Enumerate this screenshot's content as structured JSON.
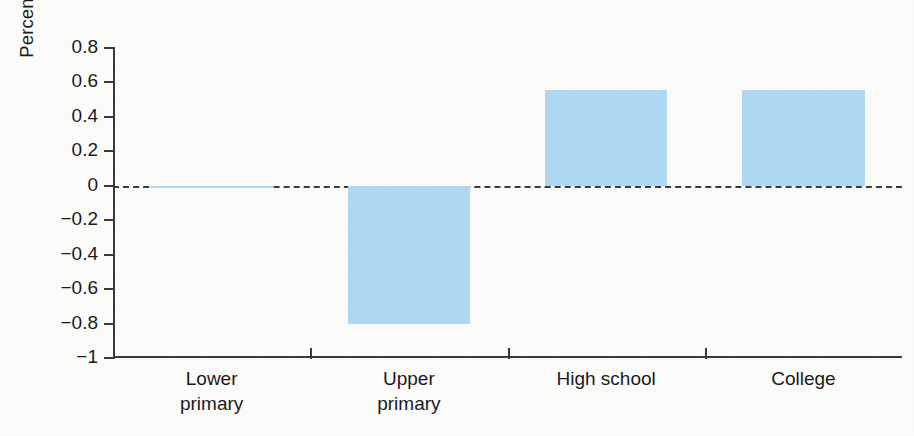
{
  "chart_data": {
    "type": "bar",
    "title": "",
    "xlabel": "",
    "ylabel": "Percentage change by education level",
    "categories": [
      "Lower\nprimary",
      "Upper\nprimary",
      "High school",
      "College"
    ],
    "category_labels_flat": [
      "Lower primary",
      "Upper primary",
      "High school",
      "College"
    ],
    "values": [
      -0.01,
      -0.8,
      0.555,
      0.555
    ],
    "ylim": [
      -1,
      0.8
    ],
    "yticks": [
      0.8,
      0.6,
      0.4,
      0.2,
      0,
      -0.2,
      -0.4,
      -0.6,
      -0.8,
      -1
    ],
    "ytick_labels": [
      "0.8",
      "0.6",
      "0.4",
      "0.2",
      "0",
      "−0.2",
      "−0.4",
      "−0.6",
      "−0.8",
      "−1"
    ],
    "grid": false,
    "legend": null,
    "zero_reference_line": true,
    "zero_line_style": "dashed",
    "bar_color": "#aed8f2",
    "axis_color": "#3a3a3a",
    "text_color": "#1b1b1b",
    "background_color": "#fbfbf9"
  }
}
